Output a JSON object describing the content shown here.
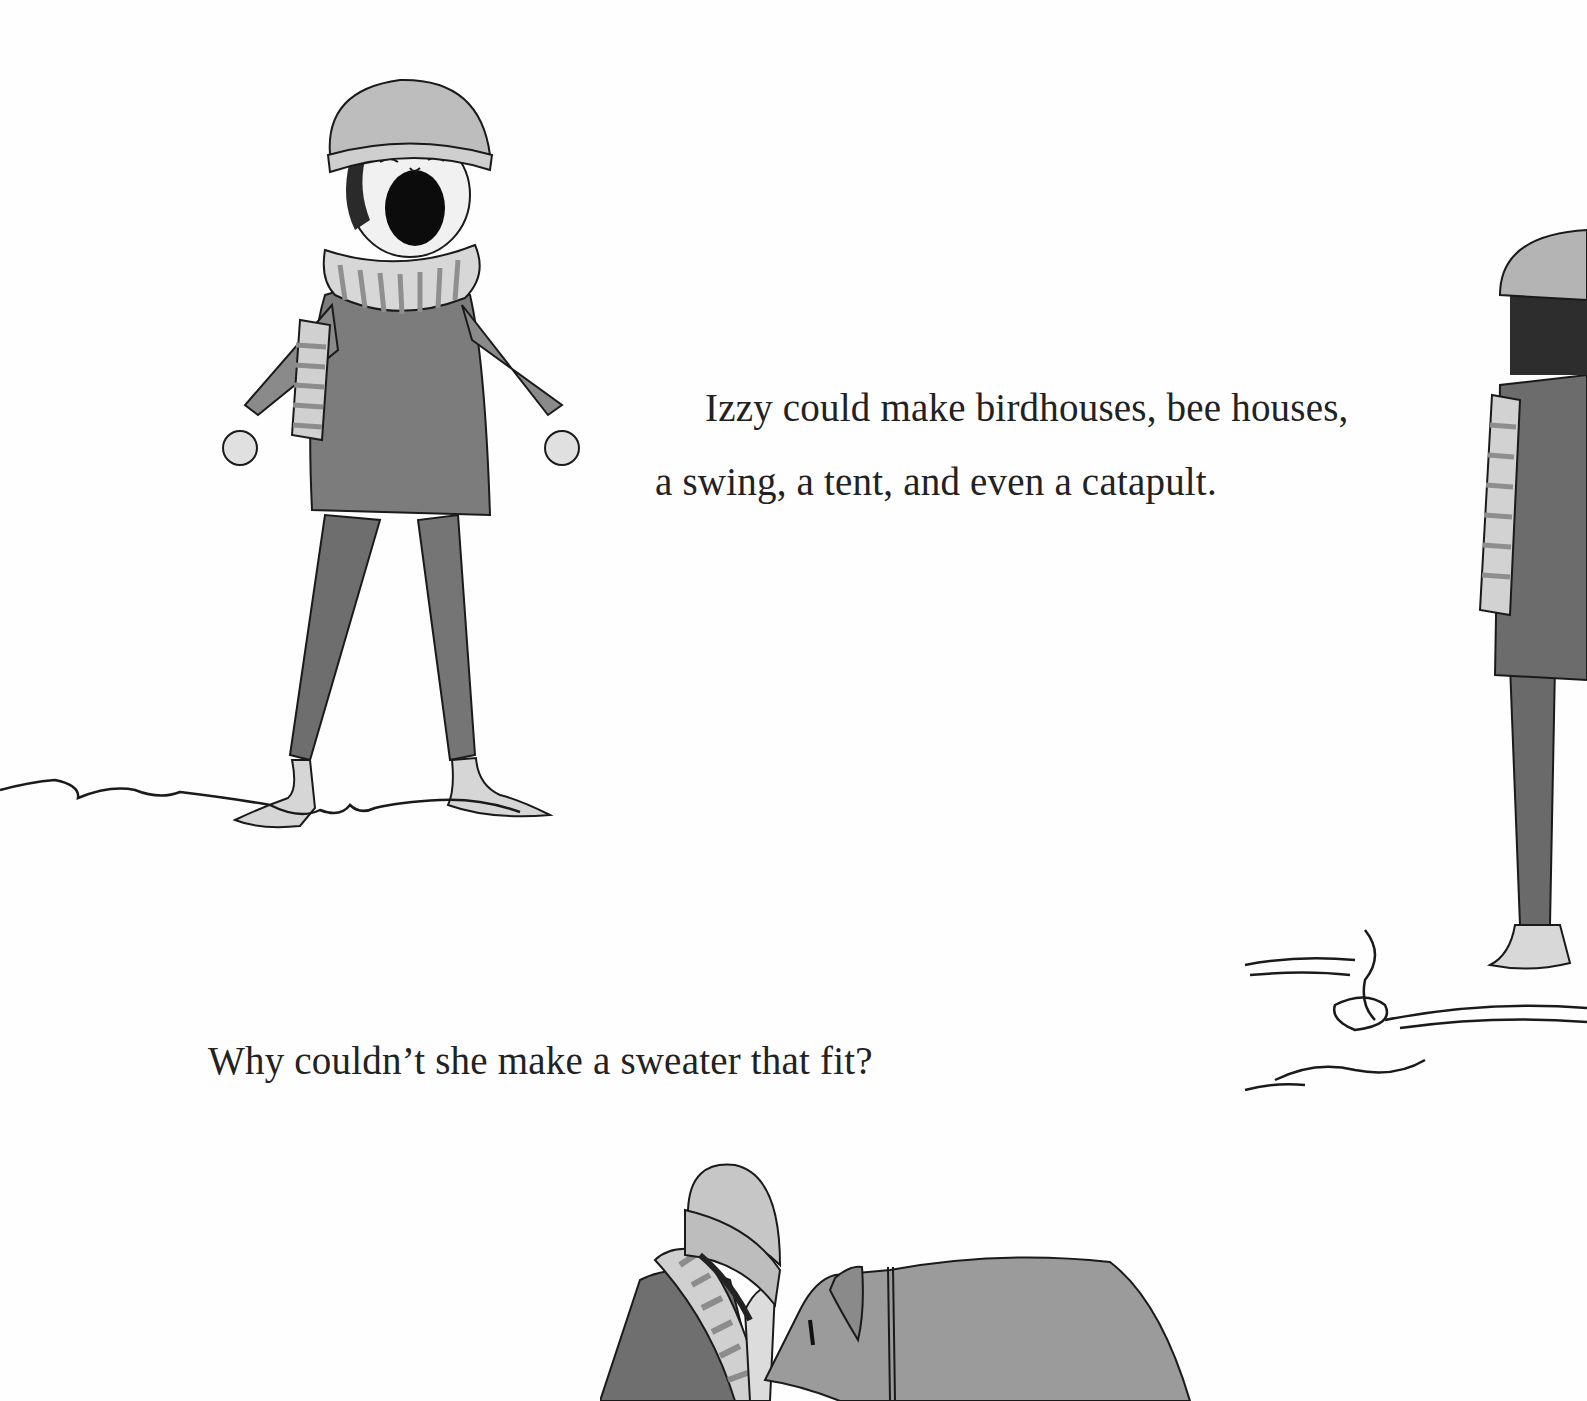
{
  "page": {
    "paragraphs": [
      {
        "lines": [
          "Izzy could make birdhouses, bee houses,",
          "a swing, a tent, and even a catapult."
        ]
      },
      {
        "lines": [
          "Why couldn’t she make a sweater that fit?"
        ]
      }
    ],
    "illustrations": [
      {
        "name": "girl-shouting",
        "description": "Girl in knit hat and striped scarf, mouth open shouting, arms out, barefoot"
      },
      {
        "name": "girl-standing-right",
        "description": "Girl in hat and striped scarf standing, partially cropped at right edge"
      },
      {
        "name": "girl-and-dog",
        "description": "Girl in hat with scarf facing a large dog, cropped at bottom"
      }
    ],
    "colors": {
      "background": "#fefefe",
      "ink": "#1a1a1a",
      "wash_dark": "#6f6f6f",
      "wash_mid": "#9a9a9a",
      "wash_light": "#c9c9c9"
    }
  }
}
